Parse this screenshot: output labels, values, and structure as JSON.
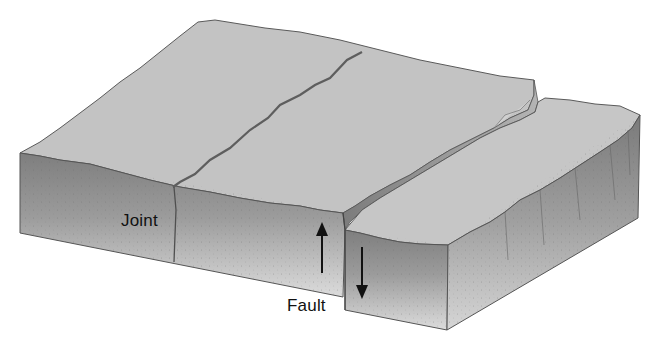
{
  "diagram": {
    "labels": {
      "joint": "Joint",
      "fault": "Fault"
    },
    "arrows": [
      {
        "name": "upthrown-block-arrow",
        "direction": "up"
      },
      {
        "name": "downthrown-block-arrow",
        "direction": "down"
      }
    ],
    "colors": {
      "top_surface": "#c4c4c4",
      "face_dark": "#8a8a8a",
      "face_light": "#d8d8d8",
      "outline": "#555555",
      "crack": "#6a6a6a",
      "label": "#111111",
      "background": "#ffffff"
    }
  }
}
